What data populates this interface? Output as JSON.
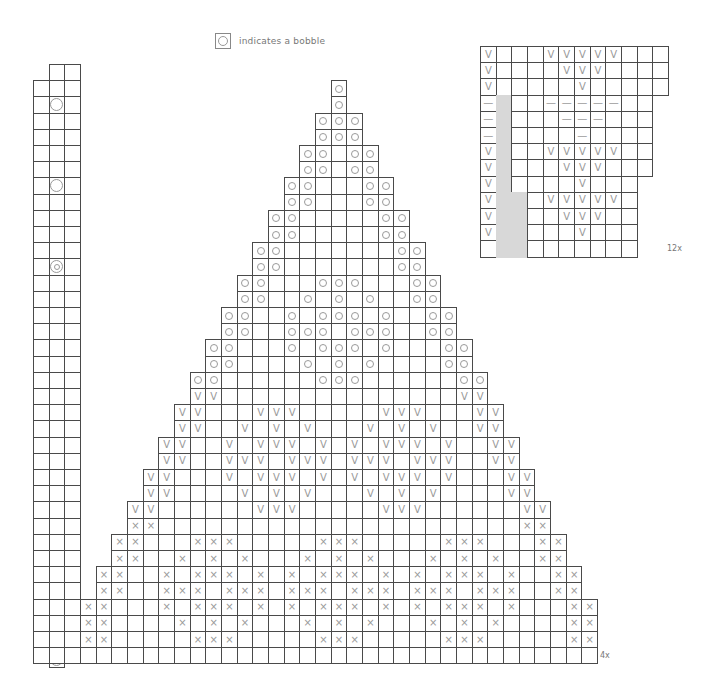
{
  "legend": {
    "symbol": "bobble-square",
    "text": "indicates a bobble"
  },
  "symbols": {
    "o": "○",
    "v": "V",
    "x": "×",
    "dash": "—"
  },
  "colors": {
    "grid_line": "#4a4a4a",
    "symbol": "#9a9a9a",
    "shaded": "#d8d8d8"
  },
  "main_chart": {
    "repeat_label": "4x",
    "origin": [
      33,
      64
    ],
    "cell": [
      15.67,
      16.2
    ],
    "left_strip": {
      "cols": [
        0,
        1,
        2
      ],
      "rows": 37,
      "bobbles": [
        {
          "row": 2,
          "col": 1,
          "type": "bob"
        },
        {
          "row": 7,
          "col": 1,
          "type": "bob"
        },
        {
          "row": 12,
          "col": 1,
          "type": "bobo"
        },
        {
          "row": 17,
          "col": 1,
          "type": "bobo"
        },
        {
          "row": 22,
          "col": 1,
          "type": "bobv",
          "label": "V"
        },
        {
          "row": 27,
          "col": 1,
          "type": "bobv",
          "label": "V"
        },
        {
          "row": 32,
          "col": 1,
          "type": "bobx",
          "label": "×"
        }
      ]
    },
    "triangle_center_col": 19,
    "triangle_max_half_width": 16,
    "rows": [
      {
        "row": 1,
        "sym": "o",
        "cols": [
          19
        ]
      },
      {
        "row": 2,
        "sym": "o",
        "cols": [
          19
        ]
      },
      {
        "row": 3,
        "sym": "o",
        "cols": [
          18,
          19,
          20
        ]
      },
      {
        "row": 4,
        "sym": "o",
        "cols": [
          18,
          19,
          20
        ]
      },
      {
        "row": 5,
        "sym": "o",
        "cols": [
          17,
          18,
          20,
          21
        ]
      },
      {
        "row": 6,
        "sym": "o",
        "cols": [
          17,
          18,
          20,
          21
        ]
      },
      {
        "row": 7,
        "sym": "o",
        "cols": [
          16,
          17,
          21,
          22
        ]
      },
      {
        "row": 8,
        "sym": "o",
        "cols": [
          16,
          17,
          21,
          22
        ]
      },
      {
        "row": 9,
        "sym": "o",
        "cols": [
          15,
          16,
          22,
          23
        ]
      },
      {
        "row": 10,
        "sym": "o",
        "cols": [
          15,
          16,
          22,
          23
        ]
      },
      {
        "row": 11,
        "sym": "o",
        "cols": [
          14,
          15,
          23,
          24
        ]
      },
      {
        "row": 12,
        "sym": "o",
        "cols": [
          14,
          15,
          23,
          24
        ]
      },
      {
        "row": 13,
        "sym": "o",
        "cols": [
          13,
          14,
          18,
          19,
          20,
          24,
          25
        ]
      },
      {
        "row": 14,
        "sym": "o",
        "cols": [
          13,
          14,
          17,
          19,
          21,
          24,
          25
        ]
      },
      {
        "row": 15,
        "sym": "o",
        "cols": [
          12,
          13,
          16,
          18,
          19,
          20,
          22,
          25,
          26
        ]
      },
      {
        "row": 16,
        "sym": "o",
        "cols": [
          12,
          13,
          16,
          17,
          18,
          20,
          21,
          22,
          25,
          26
        ]
      },
      {
        "row": 17,
        "sym": "o",
        "cols": [
          11,
          12,
          16,
          18,
          19,
          20,
          22,
          26,
          27
        ]
      },
      {
        "row": 18,
        "sym": "o",
        "cols": [
          11,
          12,
          17,
          19,
          21,
          26,
          27
        ]
      },
      {
        "row": 19,
        "sym": "o",
        "cols": [
          10,
          11,
          18,
          19,
          20,
          27,
          28
        ]
      },
      {
        "row": 20,
        "sym": "v",
        "cols": [
          10,
          11,
          27,
          28
        ]
      },
      {
        "row": 21,
        "sym": "v",
        "cols": [
          9,
          10,
          14,
          15,
          16,
          22,
          23,
          24,
          28,
          29
        ]
      },
      {
        "row": 22,
        "sym": "v",
        "cols": [
          9,
          10,
          13,
          15,
          17,
          21,
          23,
          25,
          28,
          29
        ]
      },
      {
        "row": 23,
        "sym": "v",
        "cols": [
          8,
          9,
          12,
          14,
          15,
          16,
          18,
          20,
          22,
          23,
          24,
          26,
          29,
          30
        ]
      },
      {
        "row": 24,
        "sym": "v",
        "cols": [
          8,
          9,
          12,
          13,
          14,
          16,
          17,
          18,
          20,
          21,
          22,
          24,
          25,
          26,
          29,
          30
        ]
      },
      {
        "row": 25,
        "sym": "v",
        "cols": [
          7,
          8,
          12,
          14,
          15,
          16,
          18,
          20,
          22,
          23,
          24,
          26,
          30,
          31
        ]
      },
      {
        "row": 26,
        "sym": "v",
        "cols": [
          7,
          8,
          13,
          15,
          17,
          21,
          23,
          25,
          30,
          31
        ]
      },
      {
        "row": 27,
        "sym": "v",
        "cols": [
          6,
          7,
          14,
          15,
          16,
          22,
          23,
          24,
          31,
          32
        ]
      },
      {
        "row": 28,
        "sym": "x",
        "cols": [
          6,
          7,
          31,
          32
        ]
      },
      {
        "row": 29,
        "sym": "x",
        "cols": [
          5,
          6,
          10,
          11,
          12,
          18,
          19,
          20,
          26,
          27,
          28,
          32,
          33
        ]
      },
      {
        "row": 30,
        "sym": "x",
        "cols": [
          5,
          6,
          9,
          11,
          13,
          17,
          19,
          21,
          25,
          27,
          29,
          32,
          33
        ]
      },
      {
        "row": 31,
        "sym": "x",
        "cols": [
          4,
          5,
          8,
          10,
          11,
          12,
          14,
          16,
          18,
          19,
          20,
          22,
          24,
          26,
          27,
          28,
          30,
          33,
          34
        ]
      },
      {
        "row": 32,
        "sym": "x",
        "cols": [
          4,
          5,
          8,
          9,
          10,
          12,
          13,
          14,
          16,
          17,
          18,
          20,
          21,
          22,
          24,
          25,
          26,
          28,
          29,
          30,
          33,
          34
        ]
      },
      {
        "row": 33,
        "sym": "x",
        "cols": [
          3,
          4,
          8,
          10,
          11,
          12,
          14,
          16,
          18,
          19,
          20,
          22,
          24,
          26,
          27,
          28,
          30,
          34,
          35
        ]
      },
      {
        "row": 34,
        "sym": "x",
        "cols": [
          3,
          4,
          9,
          11,
          13,
          17,
          19,
          21,
          25,
          27,
          29,
          34,
          35
        ]
      },
      {
        "row": 35,
        "sym": "x",
        "cols": [
          3,
          4,
          10,
          11,
          12,
          18,
          19,
          20,
          26,
          27,
          28,
          34,
          35
        ]
      },
      {
        "row": 36,
        "sym": "none",
        "cols": []
      }
    ]
  },
  "side_chart": {
    "repeat_label": "12x",
    "origin": [
      480,
      46
    ],
    "cell": [
      15.67,
      16.2
    ],
    "row_widths": [
      12,
      12,
      12,
      11,
      11,
      11,
      11,
      11,
      10,
      10,
      10,
      10,
      10
    ],
    "shaded": [
      {
        "rows": [
          3,
          8
        ],
        "cols": [
          1
        ]
      },
      {
        "rows": [
          9,
          12
        ],
        "cols": [
          1,
          2
        ]
      }
    ],
    "rows": [
      {
        "row": 0,
        "sym": "v",
        "cols": [
          0,
          4,
          5,
          6,
          7,
          8
        ]
      },
      {
        "row": 1,
        "sym": "v",
        "cols": [
          0,
          5,
          6,
          7
        ]
      },
      {
        "row": 2,
        "sym": "v",
        "cols": [
          0,
          6
        ]
      },
      {
        "row": 3,
        "sym": "dash",
        "cols": [
          0,
          4,
          5,
          6,
          7,
          8
        ]
      },
      {
        "row": 4,
        "sym": "dash",
        "cols": [
          0,
          5,
          6,
          7
        ]
      },
      {
        "row": 5,
        "sym": "dash",
        "cols": [
          0,
          6
        ]
      },
      {
        "row": 6,
        "sym": "v",
        "cols": [
          0,
          4,
          5,
          6,
          7,
          8
        ]
      },
      {
        "row": 7,
        "sym": "v",
        "cols": [
          0,
          5,
          6,
          7
        ]
      },
      {
        "row": 8,
        "sym": "v",
        "cols": [
          0,
          6
        ]
      },
      {
        "row": 9,
        "sym": "v",
        "cols": [
          0,
          4,
          5,
          6,
          7,
          8
        ]
      },
      {
        "row": 10,
        "sym": "v",
        "cols": [
          0,
          5,
          6,
          7
        ]
      },
      {
        "row": 11,
        "sym": "v",
        "cols": [
          0,
          6
        ]
      },
      {
        "row": 12,
        "sym": "none",
        "cols": []
      }
    ]
  }
}
